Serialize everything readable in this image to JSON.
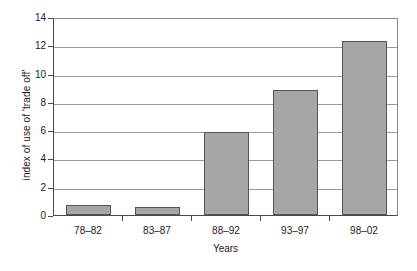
{
  "chart_data": {
    "type": "bar",
    "title": "",
    "xlabel": "Years",
    "ylabel": "index of use of 'trade off'",
    "categories": [
      "78–82",
      "83–87",
      "88–92",
      "93–97",
      "98–02"
    ],
    "values": [
      0.7,
      0.55,
      5.9,
      8.85,
      12.3
    ],
    "ylim": [
      0,
      14
    ],
    "yticks": [
      0,
      2,
      4,
      6,
      8,
      10,
      12,
      14
    ],
    "ytick_labels": [
      "0",
      "2",
      "4",
      "6",
      "8",
      "10",
      "12",
      "14"
    ],
    "grid": "horizontal",
    "legend": "none",
    "bar_color": "#a6a6a6",
    "bar_border_color": "#555555",
    "axis_color": "#4a4a4a",
    "gridline_color": "#9a9a9a",
    "background": "#ffffff"
  }
}
